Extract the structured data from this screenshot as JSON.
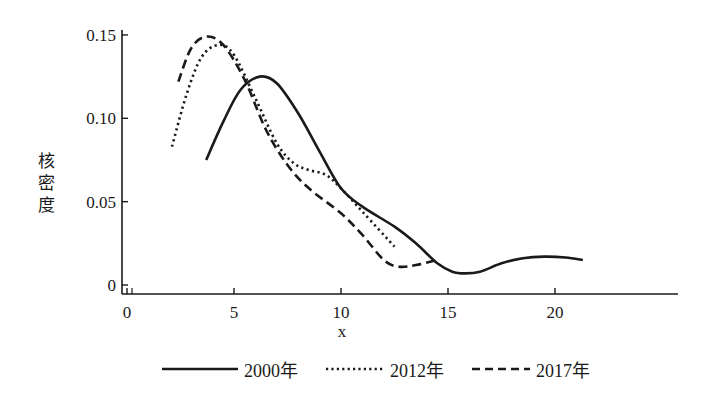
{
  "chart_data": {
    "type": "line",
    "title": "",
    "xlabel": "x",
    "ylabel": "核密度",
    "xlim": [
      -0.2,
      21.8
    ],
    "ylim": [
      0,
      0.155
    ],
    "x_ticks": [
      0,
      5,
      10,
      15,
      20
    ],
    "x_tick_labels": [
      "0",
      "5",
      "10",
      "15",
      "20"
    ],
    "y_ticks": [
      0,
      0.05,
      0.1,
      0.15
    ],
    "y_tick_labels": [
      "0",
      "0.05",
      "0.10",
      "0.15"
    ],
    "grid": false,
    "legend_position": "bottom",
    "series": [
      {
        "name": "2000年",
        "style": "solid",
        "x": [
          3.7,
          4.5,
          5.3,
          6.2,
          7.0,
          8.0,
          9.0,
          10.0,
          11.0,
          12.5,
          13.5,
          14.5,
          15.2,
          15.8,
          16.5,
          17.5,
          18.5,
          19.5,
          20.5,
          21.3
        ],
        "y": [
          0.075,
          0.098,
          0.117,
          0.125,
          0.121,
          0.103,
          0.08,
          0.058,
          0.047,
          0.035,
          0.025,
          0.013,
          0.008,
          0.007,
          0.008,
          0.013,
          0.016,
          0.017,
          0.0165,
          0.015
        ]
      },
      {
        "name": "2012年",
        "style": "dotted",
        "x": [
          2.1,
          2.8,
          3.5,
          4.3,
          5.0,
          6.0,
          7.0,
          7.8,
          8.5,
          9.3,
          10.0,
          11.0,
          12.5
        ],
        "y": [
          0.083,
          0.115,
          0.137,
          0.144,
          0.138,
          0.112,
          0.085,
          0.073,
          0.069,
          0.066,
          0.058,
          0.044,
          0.023
        ]
      },
      {
        "name": "2017年",
        "style": "dashed",
        "x": [
          2.4,
          3.0,
          3.7,
          4.5,
          5.5,
          6.5,
          7.5,
          8.5,
          10.0,
          11.0,
          12.0,
          12.7,
          13.5,
          14.5
        ],
        "y": [
          0.122,
          0.142,
          0.149,
          0.144,
          0.123,
          0.093,
          0.072,
          0.058,
          0.043,
          0.03,
          0.015,
          0.011,
          0.012,
          0.015
        ]
      }
    ]
  },
  "legend": {
    "items": [
      {
        "label": "2000年",
        "style": "solid"
      },
      {
        "label": "2012年",
        "style": "dotted"
      },
      {
        "label": "2017年",
        "style": "dashed"
      }
    ]
  },
  "colors": {
    "line": "#1a1a1a",
    "background": "#ffffff"
  }
}
